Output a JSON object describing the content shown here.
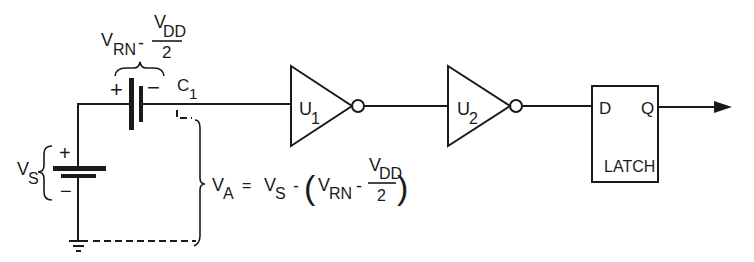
{
  "diagram": {
    "type": "circuit-schematic",
    "colors": {
      "ink": "#1a1a1a",
      "background": "#ffffff"
    },
    "source_battery": {
      "label_main": "V",
      "label_sub": "S",
      "plus": "+",
      "minus": "−"
    },
    "capacitor": {
      "label_main": "C",
      "label_sub": "1",
      "plus": "+",
      "minus": "−"
    },
    "capacitor_voltage": {
      "term1_main": "V",
      "term1_sub": "RN",
      "operator": "-",
      "frac_num_main": "V",
      "frac_num_sub": "DD",
      "frac_den": "2"
    },
    "va_equation": {
      "lhs_main": "V",
      "lhs_sub": "A",
      "equals": "=",
      "vs_main": "V",
      "vs_sub": "S",
      "minus": "-",
      "open_paren": "(",
      "vrn_main": "V",
      "vrn_sub": "RN",
      "inner_minus": "-",
      "frac_num_main": "V",
      "frac_num_sub": "DD",
      "frac_den": "2",
      "close_paren": ")"
    },
    "inverter1": {
      "label_main": "U",
      "label_sub": "1"
    },
    "inverter2": {
      "label_main": "U",
      "label_sub": "2"
    },
    "latch": {
      "input": "D",
      "output": "Q",
      "name": "LATCH"
    }
  }
}
